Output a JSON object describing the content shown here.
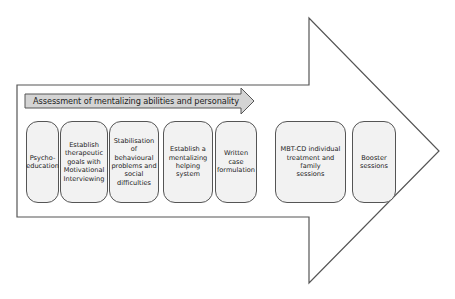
{
  "diagram": {
    "type": "process-arrow",
    "colors": {
      "outline": "#555555",
      "assessment_arrow_fill": "#d4d4d4",
      "step_fill": "#f2f2f2",
      "background": "#ffffff"
    },
    "assessment_arrow": {
      "label": "Assessment of mentalizing abilities and personality"
    },
    "steps": [
      {
        "label": "Psycho-education",
        "lines": [
          "Psycho-",
          "education"
        ]
      },
      {
        "label": "Establish therapeutic goals with Motivational Interviewing",
        "lines": [
          "Establish",
          "therapeutic",
          "goals with",
          "Motivational",
          "Interviewing"
        ]
      },
      {
        "label": "Stabilisation of behavioural problems and social difficulties",
        "lines": [
          "Stabilisation of",
          "behavioural",
          "problems and",
          "social difficulties"
        ]
      },
      {
        "label": "Establish a mentalizing helping system",
        "lines": [
          "Establish a",
          "mentalizing",
          "helping system"
        ]
      },
      {
        "label": "Written case formulation",
        "lines": [
          "Written",
          "case",
          "formulation"
        ]
      },
      {
        "label": "MBT-CD individual treatment and family sessions",
        "lines": [
          "MBT-CD individual",
          "treatment and family",
          "sessions"
        ]
      },
      {
        "label": "Booster sessions",
        "lines": [
          "Booster",
          "sessions"
        ]
      }
    ]
  }
}
